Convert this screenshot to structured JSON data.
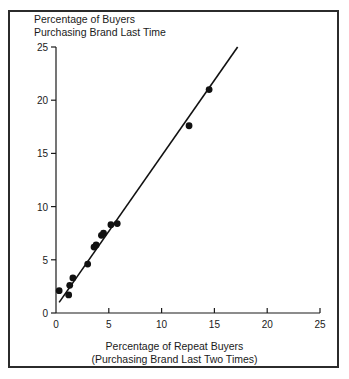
{
  "chart_data": {
    "type": "scatter",
    "title": "Percentage of Buyers Purchasing Brand Last Time",
    "title_lines": [
      "Percentage of Buyers",
      "Purchasing Brand Last Time"
    ],
    "xlabel": "Percentage of Repeat Buyers (Purchasing Brand Last Two Times)",
    "xlabel_lines": [
      "Percentage of Repeat Buyers",
      "(Purchasing Brand Last Two Times)"
    ],
    "ylabel": "Percentage of Buyers Purchasing Brand Last Time",
    "xlim": [
      0,
      25
    ],
    "ylim": [
      0,
      25
    ],
    "xticks": [
      0,
      5,
      10,
      15,
      20,
      25
    ],
    "yticks": [
      0,
      5,
      10,
      15,
      20,
      25
    ],
    "xtick_labels": [
      "0",
      "5",
      "10",
      "15",
      "20",
      "25"
    ],
    "ytick_labels": [
      "0",
      "5",
      "10",
      "15",
      "20",
      "25"
    ],
    "grid": false,
    "legend": "none",
    "marker": "filled-circle",
    "marker_color": "#111111",
    "line_color": "#111111",
    "points": [
      {
        "x": 0.3,
        "y": 2.1
      },
      {
        "x": 1.2,
        "y": 1.7
      },
      {
        "x": 1.3,
        "y": 2.6
      },
      {
        "x": 1.6,
        "y": 3.3
      },
      {
        "x": 3.0,
        "y": 4.6
      },
      {
        "x": 3.6,
        "y": 6.2
      },
      {
        "x": 3.8,
        "y": 6.4
      },
      {
        "x": 4.3,
        "y": 7.3
      },
      {
        "x": 4.5,
        "y": 7.5
      },
      {
        "x": 5.2,
        "y": 8.3
      },
      {
        "x": 5.8,
        "y": 8.4
      },
      {
        "x": 12.6,
        "y": 17.6
      },
      {
        "x": 14.5,
        "y": 21.0
      }
    ],
    "fit_line": {
      "x0": 0.3,
      "y0": 1.0,
      "x1": 17.2,
      "y1": 25.0
    }
  },
  "colors": {
    "frame": "#2b2b2b",
    "axis": "#1a1a1a",
    "marker": "#111111",
    "line": "#111111",
    "background": "#ffffff"
  }
}
